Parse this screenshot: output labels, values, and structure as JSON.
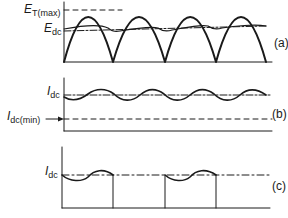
{
  "panels": [
    {
      "id": "a",
      "tag": "(a)",
      "labels": {
        "emax_main": "E",
        "emax_sub": "T(max)",
        "edc_main": "E",
        "edc_sub": "dc"
      },
      "description": "Full-wave rectified voltage with peak E_T(max) and DC level E_dc"
    },
    {
      "id": "b",
      "tag": "(b)",
      "labels": {
        "idc_main": "I",
        "idc_sub": "dc",
        "idcmin_main": "I",
        "idcmin_sub": "dc(min)"
      },
      "description": "Continuous inductor current with ripple around I_dc, above I_dc(min)"
    },
    {
      "id": "c",
      "tag": "(c)",
      "labels": {
        "idc_main": "I",
        "idc_sub": "dc"
      },
      "description": "Discontinuous current pulses around I_dc level"
    }
  ],
  "colors": {
    "stroke": "#1a1a1a",
    "background": "#ffffff"
  }
}
